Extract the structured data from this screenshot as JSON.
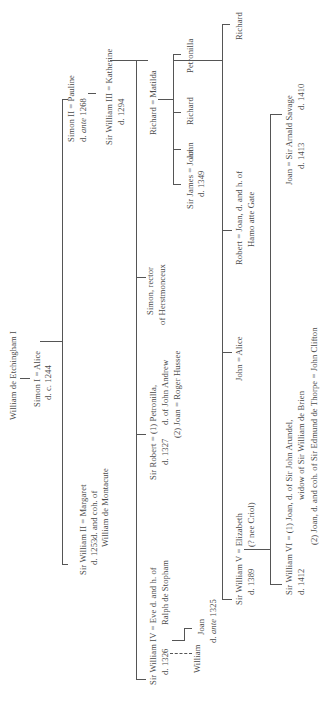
{
  "people": {
    "root": "William de Etchingham I",
    "simon1": "Simon I = Alice",
    "simon1_d": "d. c. 1244",
    "simon2": "Simon II = Pauline",
    "simon2_d": "d. ante 1268",
    "william3": "Sir William III = Katherine",
    "william3_d": "d. 1294",
    "william2": "Sir William II = Margaret",
    "william2_d": "d. 1253",
    "margaret_note1": "d. and coh. of",
    "margaret_note2": "William de Montacute",
    "richard_matilda": "Richard = Matilda",
    "petronilla": "Petronilla",
    "richard_child": "Richard",
    "john_child": "John",
    "james": "Sir James = Joan",
    "james_d": "d. 1349",
    "simon_rector1": "Simon, rector",
    "simon_rector2": "of Herstmonceux",
    "robert_sir": "Sir Robert = (1) Petronilla,",
    "robert_sir_d": "d. 1327",
    "petronilla_note": "d. of John Andrew",
    "robert_sir_2": "(2) Joan = Roger Hussee",
    "william4": "Sir William IV = Eve d. and h. of",
    "william4_d": "d. 1326",
    "eve_note": "Ralph de Stopham",
    "joan_daughter": "Joan",
    "joan_daughter_d": "d. ante 1325",
    "william_son": "William",
    "richard_far": "Richard",
    "robert": "Robert = Joan, d. and h. of",
    "robert_note": "Hamo atte Gate",
    "john_alice": "John = Alice",
    "william5": "Sir William V = Elizabeth",
    "william5_d": "d. 1389",
    "elizabeth_note": "(? nee Criol)",
    "joan_savage": "Joan = Sir Arnald Savage",
    "joan_d": "d. 1413",
    "savage_d": "d. 1410",
    "william6": "Sir William VI = (1) Joan, d. of Sir John Arundel,",
    "william6_d": "d. 1412",
    "william6_note": "widow of Sir William de Brien",
    "william6_2": "(2) Joan, d. and coh. of Sir Edmund de Thorpe = John Clifton"
  }
}
